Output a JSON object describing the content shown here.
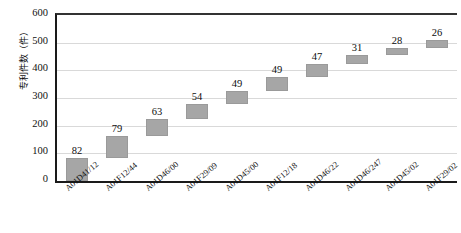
{
  "chart_data": {
    "type": "bar",
    "subtype": "waterfall",
    "title": "",
    "xlabel": "",
    "ylabel": "专利件数（件）",
    "ylim": [
      0,
      600
    ],
    "ytick_step": 100,
    "ytick_labels": [
      "600",
      "500",
      "400",
      "300",
      "200",
      "100",
      "0"
    ],
    "grid": true,
    "legend": "none",
    "categories": [
      "A01D41/12",
      "A01F12/44",
      "A01D46/00",
      "A01F29/09",
      "A01D45/00",
      "A01F12/18",
      "A01D46/22",
      "A01D46/247",
      "A01D45/02",
      "A01F29/02"
    ],
    "values": [
      82,
      79,
      63,
      54,
      49,
      49,
      47,
      31,
      28,
      26
    ],
    "cumulative_base": [
      0,
      82,
      161,
      224,
      278,
      327,
      376,
      423,
      454,
      482
    ],
    "cumulative_top": [
      82,
      161,
      224,
      278,
      327,
      376,
      423,
      454,
      482,
      508
    ],
    "data_labels": [
      "82",
      "79",
      "63",
      "54",
      "49",
      "49",
      "47",
      "31",
      "28",
      "26"
    ],
    "bar_color": "#a6a6a6",
    "gridline_color": "#d9d9d9",
    "axis_color": "#1a1a1a"
  }
}
